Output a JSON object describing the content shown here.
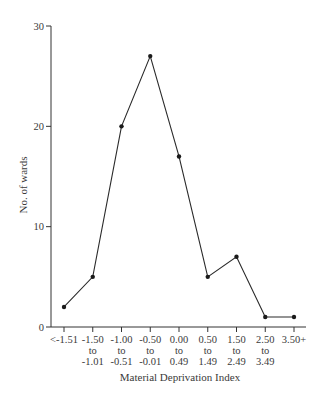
{
  "chart_data": {
    "type": "line",
    "title": "",
    "xlabel": "Material Deprivation Index",
    "ylabel": "No. of wards",
    "categories": [
      [
        "<-1.51"
      ],
      [
        "-1.50",
        "to",
        "-1.01"
      ],
      [
        "-1.00",
        "to",
        "-0.51"
      ],
      [
        "-0.50",
        "to",
        "-0.01"
      ],
      [
        "0.00",
        "to",
        "0.49"
      ],
      [
        "0.50",
        "to",
        "1.49"
      ],
      [
        "1.50",
        "to",
        "2.49"
      ],
      [
        "2.50",
        "to",
        "3.49"
      ],
      [
        "3.50+"
      ]
    ],
    "series": [
      {
        "name": "No. of wards",
        "values": [
          2,
          5,
          20,
          27,
          17,
          5,
          7,
          1,
          1
        ]
      }
    ],
    "ylim": [
      0,
      30
    ],
    "yticks": [
      0,
      10,
      20,
      30
    ],
    "grid": false,
    "legend": "none",
    "markers": true
  }
}
